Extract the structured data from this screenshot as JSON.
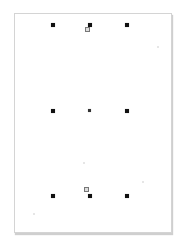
{
  "document": {
    "type": "blank page with alignment marks",
    "colors": {
      "mark": "#111111",
      "page": "#ffffff",
      "border": "#d4d4d4"
    },
    "marks": [
      {
        "row": "top",
        "x": 53,
        "y": 25
      },
      {
        "row": "top",
        "x": 90,
        "y": 25
      },
      {
        "row": "top",
        "x": 127,
        "y": 25
      },
      {
        "row": "middle",
        "x": 53,
        "y": 111
      },
      {
        "row": "middle",
        "x": 90,
        "y": 111,
        "style": "x"
      },
      {
        "row": "middle",
        "x": 127,
        "y": 111
      },
      {
        "row": "bottom",
        "x": 53,
        "y": 196
      },
      {
        "row": "bottom",
        "x": 90,
        "y": 196
      },
      {
        "row": "bottom",
        "x": 127,
        "y": 196
      }
    ],
    "small_boxes": [
      {
        "x": 85,
        "y": 27
      },
      {
        "x": 84,
        "y": 187
      }
    ]
  }
}
